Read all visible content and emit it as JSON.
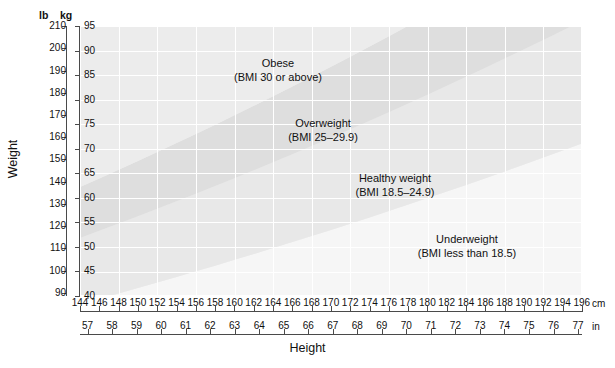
{
  "chart_data": {
    "type": "area",
    "xlabel": "Height",
    "ylabel": "Weight",
    "x_axes": [
      {
        "unit": "cm",
        "range": [
          144,
          196
        ],
        "ticks": [
          144,
          146,
          148,
          150,
          152,
          154,
          156,
          158,
          160,
          162,
          164,
          166,
          168,
          170,
          172,
          174,
          176,
          178,
          180,
          182,
          184,
          186,
          188,
          190,
          192,
          194,
          196
        ]
      },
      {
        "unit": "in",
        "range": [
          56.7,
          77.2
        ],
        "ticks": [
          57,
          58,
          59,
          60,
          61,
          62,
          63,
          64,
          65,
          66,
          67,
          68,
          69,
          70,
          71,
          72,
          73,
          74,
          75,
          76,
          77
        ]
      }
    ],
    "y_axes": [
      {
        "unit": "lb",
        "range": [
          88.2,
          209.4
        ],
        "ticks": [
          90,
          100,
          110,
          120,
          130,
          140,
          150,
          160,
          170,
          180,
          190,
          200,
          210
        ]
      },
      {
        "unit": "kg",
        "range": [
          40,
          95
        ],
        "ticks": [
          40,
          45,
          50,
          55,
          60,
          65,
          70,
          75,
          80,
          85,
          90,
          95
        ]
      }
    ],
    "grid": true,
    "legend_position": "inline-annotations",
    "bands": [
      {
        "name": "Underweight",
        "label_line1": "Underweight",
        "label_line2": "(BMI less than 18.5)",
        "bmi_min": 0,
        "bmi_max": 18.5,
        "fill": "#f6f6f6"
      },
      {
        "name": "Healthy weight",
        "label_line1": "Healthy weight",
        "label_line2": "(BMI 18.5–24.9)",
        "bmi_min": 18.5,
        "bmi_max": 25,
        "fill": "#e8e8e8"
      },
      {
        "name": "Overweight",
        "label_line1": "Overweight",
        "label_line2": "(BMI 25–29.9)",
        "bmi_min": 25,
        "bmi_max": 30,
        "fill": "#dedede"
      },
      {
        "name": "Obese",
        "label_line1": "Obese",
        "label_line2": "(BMI 30 or above)",
        "bmi_min": 30,
        "bmi_max": 99,
        "fill": "#ececec"
      }
    ],
    "plot_background": "#ededed",
    "gridline_color": "#ffffff",
    "axis_color": "#4a4a4a"
  },
  "axes": {
    "weight_title": "Weight",
    "height_title": "Height",
    "lb_head": "lb",
    "kg_head": "kg",
    "cm_unit": "cm",
    "in_unit": "in",
    "lb_ticks": [
      "210",
      "200",
      "190",
      "180",
      "170",
      "160",
      "150",
      "140",
      "130",
      "120",
      "110",
      "100",
      "90"
    ],
    "kg_ticks": [
      "95",
      "90",
      "85",
      "80",
      "75",
      "70",
      "65",
      "60",
      "55",
      "50",
      "45",
      "40"
    ],
    "cm_ticks": [
      "144",
      "146",
      "148",
      "150",
      "152",
      "154",
      "156",
      "158",
      "160",
      "162",
      "164",
      "166",
      "168",
      "170",
      "172",
      "174",
      "176",
      "178",
      "180",
      "182",
      "184",
      "186",
      "188",
      "190",
      "192",
      "194",
      "196"
    ],
    "in_ticks": [
      "57",
      "58",
      "59",
      "60",
      "61",
      "62",
      "63",
      "64",
      "65",
      "66",
      "67",
      "68",
      "69",
      "70",
      "71",
      "72",
      "73",
      "74",
      "75",
      "76",
      "77"
    ]
  },
  "bands": {
    "obese": {
      "line1": "Obese",
      "line2": "(BMI 30 or above)"
    },
    "overweight": {
      "line1": "Overweight",
      "line2": "(BMI 25–29.9)"
    },
    "healthy": {
      "line1": "Healthy weight",
      "line2": "(BMI 18.5–24.9)"
    },
    "underweight": {
      "line1": "Underweight",
      "line2": "(BMI less than 18.5)"
    }
  }
}
